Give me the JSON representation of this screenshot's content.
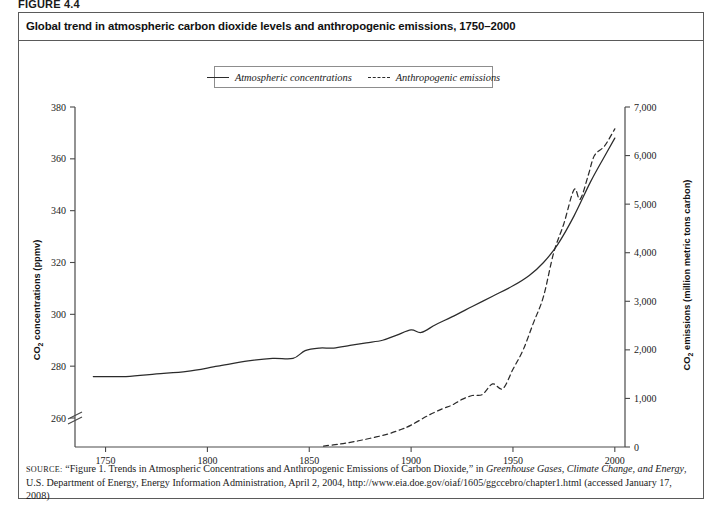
{
  "figure": {
    "label": "FIGURE 4.4",
    "title": "Global trend in atmospheric carbon dioxide levels and anthropogenic emissions, 1750–2000"
  },
  "legend": {
    "entries": [
      {
        "label": "Atmospheric concentrations",
        "style": "solid"
      },
      {
        "label": "Anthropogenic emissions",
        "style": "dashed"
      }
    ]
  },
  "source": {
    "prefix": "SOURCE:",
    "line_1": " “Figure 1. Trends in Atmospheric Concentrations and Anthropogenic Emissions of Carbon Dioxide,” in ",
    "italic_1": "Greenhouse Gases, Climate Change, and Energy",
    "line_2": ", U.S. Department of Energy, Energy Information Administration, April 2, 2004, http://www.eia.doe.gov/oiaf/1605/ggccebro/chapter1.html (accessed January 17, 2008)"
  },
  "chart_data": {
    "type": "line",
    "title": "Global trend in atmospheric carbon dioxide levels and anthropogenic emissions, 1750–2000",
    "xlabel": "",
    "xlim": [
      1735,
      2005
    ],
    "xticks": [
      1750,
      1800,
      1850,
      1900,
      1950,
      2000
    ],
    "xtick_labels": [
      "1750",
      "1800",
      "1850",
      "1900",
      "1950",
      "2000"
    ],
    "grid": false,
    "legend_position": "top-center",
    "axis_break_left": true,
    "left_axis": {
      "ylabel": "CO2 concentrations (ppmv)",
      "ylabel_html": "CO<sub>2</sub> concentrations (ppmv)",
      "ylim": [
        260,
        380
      ],
      "yticks": [
        260,
        280,
        300,
        320,
        340,
        360,
        380
      ],
      "ytick_labels": [
        "260",
        "280",
        "300",
        "320",
        "340",
        "360",
        "380"
      ]
    },
    "right_axis": {
      "ylabel": "CO2 emissions (million metric tons carbon)",
      "ylabel_html": "CO<sub>2</sub> emissions (million metric tons carbon)",
      "ylim": [
        0,
        7000
      ],
      "yticks": [
        0,
        1000,
        2000,
        3000,
        4000,
        5000,
        6000,
        7000
      ],
      "ytick_labels": [
        "0",
        "1,000",
        "2,000",
        "3,000",
        "4,000",
        "5,000",
        "6,000",
        "7,000"
      ]
    },
    "series": [
      {
        "name": "Atmospheric concentrations",
        "style": "solid",
        "axis": "left",
        "units": "ppmv",
        "x": [
          1744,
          1760,
          1775,
          1790,
          1805,
          1820,
          1832,
          1842,
          1848,
          1855,
          1862,
          1870,
          1878,
          1886,
          1893,
          1900,
          1905,
          1912,
          1920,
          1930,
          1940,
          1950,
          1958,
          1965,
          1972,
          1980,
          1988,
          1995,
          2000
        ],
        "values": [
          276,
          276,
          277,
          278,
          280,
          282,
          283,
          283,
          286,
          287,
          287,
          288,
          289,
          290,
          292,
          294,
          293,
          296,
          299,
          303,
          307,
          311,
          315,
          320,
          327,
          338,
          351,
          361,
          368
        ]
      },
      {
        "name": "Anthropogenic emissions",
        "style": "dashed",
        "axis": "right",
        "units": "million metric tons carbon",
        "x": [
          1857,
          1865,
          1872,
          1880,
          1888,
          1895,
          1900,
          1908,
          1915,
          1920,
          1925,
          1930,
          1935,
          1940,
          1945,
          1950,
          1955,
          1960,
          1965,
          1970,
          1975,
          1980,
          1983,
          1987,
          1990,
          1995,
          2000
        ],
        "values": [
          20,
          60,
          110,
          180,
          260,
          360,
          450,
          640,
          780,
          860,
          980,
          1060,
          1080,
          1300,
          1200,
          1600,
          2000,
          2550,
          3100,
          4000,
          4600,
          5300,
          5100,
          5600,
          6000,
          6200,
          6550
        ]
      }
    ]
  }
}
